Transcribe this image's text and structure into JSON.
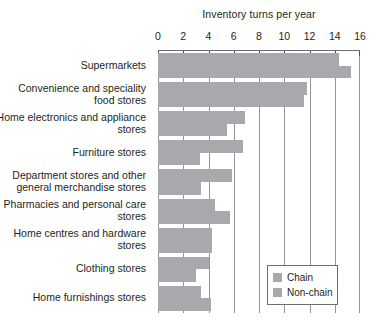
{
  "chart_data": {
    "type": "bar",
    "orientation": "horizontal",
    "title": "Inventory turns per year",
    "xlabel": "",
    "ylabel": "",
    "xlim": [
      0,
      16
    ],
    "xticks": [
      0,
      2,
      4,
      6,
      8,
      10,
      12,
      14,
      16
    ],
    "xticklabels": [
      "0",
      "2",
      "4",
      "6",
      "8",
      "10",
      "12",
      "14",
      "16"
    ],
    "grid": true,
    "grid_axis": "x",
    "legend_position": "bottom-right",
    "categories": [
      "Supermarkets",
      "Convenience and speciality food stores",
      "Home electronics and appliance stores",
      "Furniture stores",
      "Department stores and other general merchandise stores",
      "Pharmacies and personal care stores",
      "Home centres and hardware stores",
      "Clothing stores",
      "Home furnishings stores"
    ],
    "series": [
      {
        "name": "Chain",
        "color": "#a7a9ac",
        "values": [
          14.3,
          11.8,
          6.9,
          6.7,
          5.9,
          4.5,
          4.3,
          4.0,
          3.4
        ]
      },
      {
        "name": "Non-chain",
        "color": "#a7a9ac",
        "values": [
          15.3,
          11.6,
          5.5,
          3.3,
          3.4,
          5.7,
          4.3,
          3.0,
          4.2
        ]
      }
    ]
  },
  "legend": {
    "items": [
      {
        "label": "Chain"
      },
      {
        "label": "Non-chain"
      }
    ]
  }
}
